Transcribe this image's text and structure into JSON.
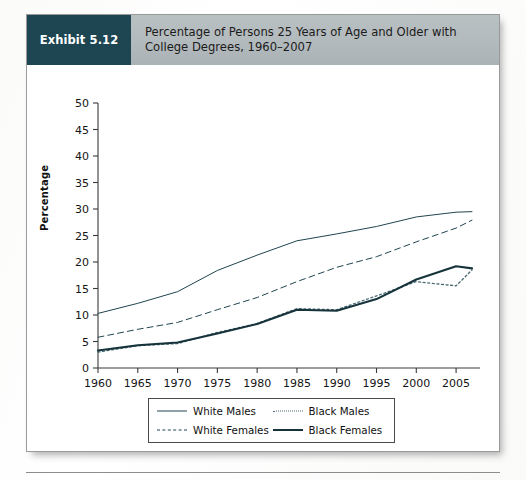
{
  "exhibit": {
    "badge_label": "Exhibit 5.12",
    "title": "Percentage of Persons 25 Years of Age and Older with College Degrees, 1960–2007",
    "badge_color": "#1d4652",
    "header_band_color": "#b3babd"
  },
  "chart_data": {
    "type": "line",
    "title": "Percentage of Persons 25 Years of Age and Older with College Degrees, 1960–2007",
    "xlabel": "",
    "ylabel": "Percentage",
    "xlim": [
      1960,
      2007
    ],
    "ylim": [
      0,
      50
    ],
    "ytick_step": 5,
    "xtick_step": 5,
    "grid": false,
    "legend_position": "bottom-center",
    "x": [
      1960,
      1965,
      1970,
      1975,
      1980,
      1985,
      1990,
      1995,
      2000,
      2005,
      2007
    ],
    "xtick_labels": [
      "1960",
      "1965",
      "1970",
      "1975",
      "1980",
      "1985",
      "1990",
      "1995",
      "2000",
      "2005"
    ],
    "ytick_labels": [
      "0",
      "5",
      "10",
      "15",
      "20",
      "25",
      "30",
      "35",
      "40",
      "45",
      "50"
    ],
    "series": [
      {
        "name": "White Males",
        "style": "solid-thin",
        "color": "#21454f",
        "values": [
          10.3,
          12.2,
          14.4,
          18.4,
          21.3,
          24.0,
          25.3,
          26.7,
          28.5,
          29.4,
          29.5
        ]
      },
      {
        "name": "White Females",
        "style": "dashed",
        "color": "#21454f",
        "values": [
          5.8,
          7.3,
          8.6,
          11.0,
          13.3,
          16.3,
          19.0,
          21.0,
          23.8,
          26.4,
          27.9
        ]
      },
      {
        "name": "Black Males",
        "style": "dotted",
        "color": "#4a6a72",
        "values": [
          3.0,
          4.2,
          4.6,
          6.7,
          8.4,
          11.2,
          11.0,
          13.6,
          16.3,
          15.5,
          18.5
        ]
      },
      {
        "name": "Black Females",
        "style": "solid-thick",
        "color": "#16333b",
        "values": [
          3.3,
          4.3,
          4.8,
          6.5,
          8.3,
          11.0,
          10.8,
          13.0,
          16.7,
          19.2,
          18.8
        ]
      }
    ]
  },
  "legend": {
    "entries": [
      {
        "label": "White Males",
        "style": "solid-thin"
      },
      {
        "label": "White Females",
        "style": "dashed"
      },
      {
        "label": "Black Males",
        "style": "dotted"
      },
      {
        "label": "Black Females",
        "style": "solid-thick"
      }
    ]
  }
}
